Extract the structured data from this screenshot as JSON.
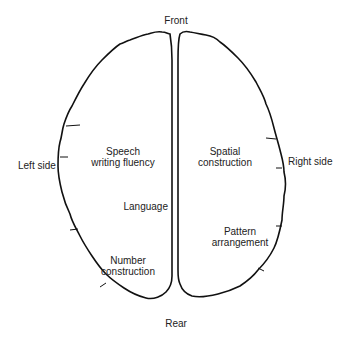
{
  "diagram": {
    "orientations": {
      "front": "Front",
      "rear": "Rear",
      "left": "Left side",
      "right": "Right side"
    },
    "left_hemisphere": {
      "functions": [
        {
          "line1": "Speech",
          "line2": "writing fluency"
        },
        {
          "line1": "Language"
        },
        {
          "line1": "Number",
          "line2": "construction"
        }
      ]
    },
    "right_hemisphere": {
      "functions": [
        {
          "line1": "Spatial",
          "line2": "construction"
        },
        {
          "line1": "Pattern",
          "line2": "arrangement"
        }
      ]
    },
    "colors": {
      "outline": "#111111",
      "background": "#ffffff",
      "text": "#222222"
    }
  }
}
